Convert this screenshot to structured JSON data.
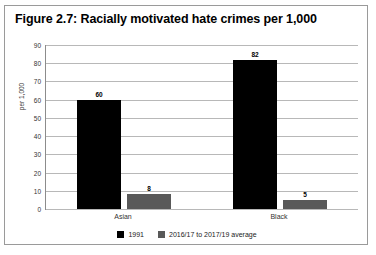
{
  "figure": {
    "title": "Figure 2.7: Racially motivated hate crimes per 1,000"
  },
  "chart_data": {
    "type": "bar",
    "title": "Figure 2.7: Racially motivated hate crimes per 1,000",
    "xlabel": "",
    "ylabel": "per 1,000",
    "ylim": [
      0,
      90
    ],
    "ytick_step": 10,
    "yticks": [
      90,
      80,
      70,
      60,
      50,
      40,
      30,
      20,
      10,
      0
    ],
    "grid": true,
    "legend_position": "bottom",
    "categories": [
      "Asian",
      "Black"
    ],
    "series": [
      {
        "name": "1991",
        "color": "#000000",
        "values": [
          60,
          82
        ],
        "labels": [
          "60",
          "82"
        ]
      },
      {
        "name": "2016/17 to 2017/19 average",
        "color": "#595959",
        "values": [
          8,
          5
        ],
        "labels": [
          "8",
          "5"
        ]
      }
    ]
  },
  "legend": {
    "items": [
      {
        "label": "1991",
        "color": "#000000"
      },
      {
        "label": "2016/17 to 2017/19 average",
        "color": "#595959"
      }
    ]
  },
  "bottom_caption": ""
}
